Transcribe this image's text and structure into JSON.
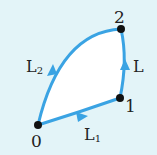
{
  "diagram": {
    "colors": {
      "background": "#e3f4f8",
      "region_fill": "#ffffff",
      "path_stroke": "#3aa3e3",
      "node_fill": "#111111",
      "text": "#222222"
    },
    "nodes": [
      {
        "id": "0",
        "label": "0",
        "x": 38,
        "y": 125
      },
      {
        "id": "1",
        "label": "1",
        "x": 120,
        "y": 98
      },
      {
        "id": "2",
        "label": "2",
        "x": 121,
        "y": 29
      }
    ],
    "edges": [
      {
        "id": "L1",
        "from": "0",
        "to": "1",
        "label": "L",
        "subscript": "1"
      },
      {
        "id": "L",
        "from": "1",
        "to": "2",
        "label": "L",
        "subscript": ""
      },
      {
        "id": "L2",
        "from": "0",
        "to": "2",
        "label": "L",
        "subscript": "2"
      }
    ]
  }
}
